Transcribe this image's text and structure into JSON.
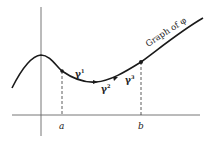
{
  "diagram": {
    "curve_label": "Graph of φ",
    "points": [
      {
        "id": "a",
        "label": "a"
      },
      {
        "id": "b",
        "label": "b"
      }
    ],
    "segments": [
      {
        "id": "gamma1",
        "label": "γ",
        "sup": "1"
      },
      {
        "id": "gamma2",
        "label": "γ",
        "sup": "2"
      },
      {
        "id": "gamma3",
        "label": "γ",
        "sup": "3"
      }
    ],
    "colors": {
      "stroke": "#1a1a1a",
      "axis": "#555555",
      "background": "#ffffff"
    }
  }
}
